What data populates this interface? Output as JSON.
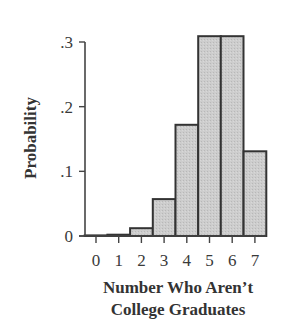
{
  "chart_data": {
    "type": "bar",
    "title": "",
    "xlabel": "Number Who Aren't College Graduates",
    "xlabel_lines": [
      "Number Who Aren’t",
      "College Graduates"
    ],
    "ylabel": "Probability",
    "categories": [
      "0",
      "1",
      "2",
      "3",
      "4",
      "5",
      "6",
      "7"
    ],
    "values": [
      0.0,
      0.002,
      0.012,
      0.057,
      0.172,
      0.309,
      0.309,
      0.131
    ],
    "ylim": [
      0,
      0.3
    ],
    "yticks": [
      0,
      0.1,
      0.2,
      0.3
    ],
    "ytick_labels": [
      "0",
      ".1",
      ".2",
      ".3"
    ],
    "grid": false,
    "legend": null,
    "colors": {
      "bar_fill": "#c9c9c9",
      "bar_edge": "#333333",
      "axis": "#444444"
    }
  }
}
